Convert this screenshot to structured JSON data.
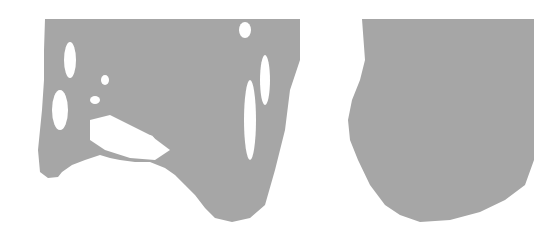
{
  "image": {
    "description": "Abstract gray brush-stroke shapes on white background",
    "fill_color": "#a6a6a6",
    "background_color": "#ffffff"
  }
}
